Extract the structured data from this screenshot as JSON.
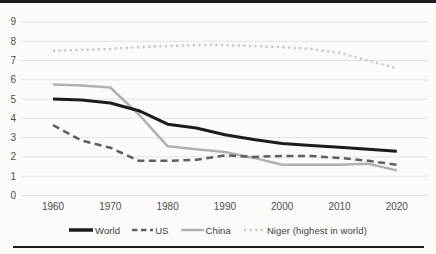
{
  "chart": {
    "background": "#fbfbf9",
    "frame_border_color": "#1c1c1c",
    "gridline_color": "#e3e3e1",
    "tick_label_color": "#4d4d4d",
    "legend_text_color": "#3d3d3d"
  },
  "chart_data": {
    "type": "line",
    "title": "",
    "xlabel": "",
    "ylabel": "",
    "x": [
      1960,
      1965,
      1970,
      1975,
      1980,
      1985,
      1990,
      1995,
      2000,
      2005,
      2010,
      2015,
      2020
    ],
    "x_ticks": [
      "1960",
      "1970",
      "1980",
      "1990",
      "2000",
      "2010",
      "2020"
    ],
    "x_tick_years": [
      1960,
      1970,
      1980,
      1990,
      2000,
      2010,
      2020
    ],
    "y_ticks": [
      "0",
      "1",
      "2",
      "3",
      "4",
      "5",
      "6",
      "7",
      "8",
      "9"
    ],
    "y_tick_values": [
      0,
      1,
      2,
      3,
      4,
      5,
      6,
      7,
      8,
      9
    ],
    "ylim": [
      0,
      9
    ],
    "grid": true,
    "legend_position": "bottom",
    "series": [
      {
        "name": "World",
        "key": "world",
        "color": "#1c1c1c",
        "style": "solid",
        "width": 3,
        "values": [
          5.0,
          4.95,
          4.8,
          4.4,
          3.7,
          3.5,
          3.15,
          2.9,
          2.7,
          2.6,
          2.5,
          2.4,
          2.3
        ]
      },
      {
        "name": "US",
        "key": "us",
        "color": "#5f5f5f",
        "style": "dashed",
        "width": 2.5,
        "values": [
          3.65,
          2.85,
          2.48,
          1.8,
          1.8,
          1.85,
          2.08,
          2.0,
          2.05,
          2.05,
          1.95,
          1.8,
          1.6
        ]
      },
      {
        "name": "China",
        "key": "china",
        "color": "#b1b1af",
        "style": "solid",
        "width": 2.5,
        "values": [
          5.75,
          5.7,
          5.6,
          4.2,
          2.55,
          2.4,
          2.25,
          1.95,
          1.6,
          1.6,
          1.6,
          1.65,
          1.3
        ]
      },
      {
        "name": "Niger (highest in world)",
        "key": "niger",
        "color": "#c8c8c6",
        "style": "dotted",
        "width": 2.5,
        "values": [
          7.5,
          7.55,
          7.6,
          7.7,
          7.75,
          7.8,
          7.8,
          7.75,
          7.7,
          7.6,
          7.4,
          7.0,
          6.6
        ]
      }
    ]
  }
}
